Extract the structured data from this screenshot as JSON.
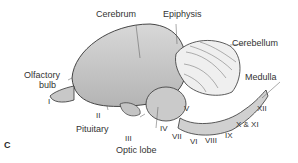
{
  "figure": {
    "panel_label": "C",
    "labels": {
      "cerebrum": "Cerebrum",
      "epiphysis": "Epiphysis",
      "cerebellum": "Cerebellum",
      "olfactory_bulb_line1": "Olfactory",
      "olfactory_bulb_line2": "bulb",
      "medulla": "Medulla",
      "pituitary": "Pituitary",
      "optic_lobe": "Optic lobe"
    },
    "cranial_nerves": {
      "I": "I",
      "II": "II",
      "III": "III",
      "IV": "IV",
      "V": "V",
      "VI": "VI",
      "VII": "VII",
      "VIII": "VIII",
      "IX": "IX",
      "X_XI": "X & XI",
      "XII": "XII"
    }
  }
}
